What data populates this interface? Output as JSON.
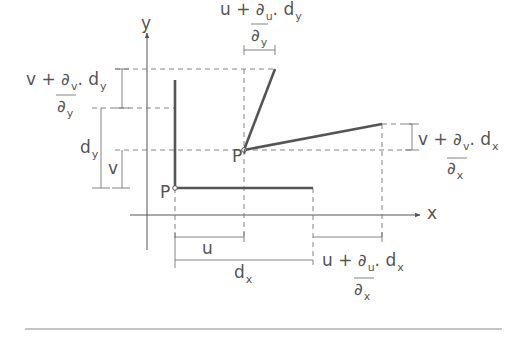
{
  "figure": {
    "axes": {
      "x_label": "x",
      "y_label": "y"
    },
    "points": {
      "p": "P",
      "p_prime": "P'"
    },
    "labels": {
      "top_u_main": "u + ∂",
      "top_u_sub": "u",
      "top_u_tail": ". d",
      "top_u_tail_sub": "y",
      "top_u_den": "∂",
      "top_u_den_sub": "y",
      "left_v_main": "v + ∂",
      "left_v_sub": "v",
      "left_v_tail": ". d",
      "left_v_tail_sub": "y",
      "left_v_den": "∂",
      "left_v_den_sub": "y",
      "dy_main": "d",
      "dy_sub": "y",
      "v": "v",
      "right_v_main": "v + ∂",
      "right_v_sub": "v",
      "right_v_tail": ". d",
      "right_v_tail_sub": "x",
      "right_v_den": "∂",
      "right_v_den_sub": "x",
      "u": "u",
      "dx_main": "d",
      "dx_sub": "x",
      "bottom_u_main": "u + ∂",
      "bottom_u_sub": "u",
      "bottom_u_tail": ". d",
      "bottom_u_tail_sub": "x",
      "bottom_u_den": "∂",
      "bottom_u_den_sub": "x"
    },
    "colors": {
      "line": "#555555",
      "thick": "#555555",
      "dash": "#777777"
    }
  }
}
